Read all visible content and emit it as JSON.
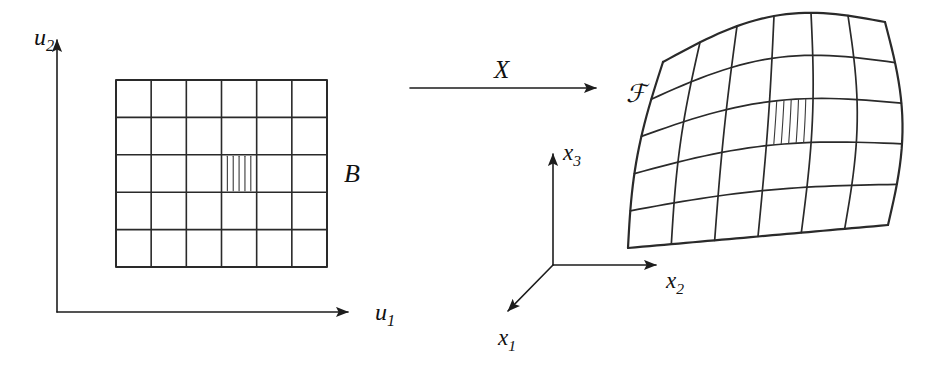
{
  "figure": {
    "type": "diagram",
    "background_color": "#ffffff",
    "ink_color": "#2a2a2a"
  },
  "labels": {
    "u_axis_vertical": "u",
    "u_axis_vertical_sub": "2",
    "u_axis_horizontal": "u",
    "u_axis_horizontal_sub": "1",
    "map_arrow": "X",
    "domain_region": "B",
    "image_region": "ℱ",
    "x1_axis": "x",
    "x1_axis_sub": "1",
    "x2_axis": "x",
    "x2_axis_sub": "2",
    "x3_axis": "x",
    "x3_axis_sub": "3"
  },
  "domain_grid": {
    "name": "B",
    "columns": 6,
    "rows": 5,
    "x0": 116,
    "y0": 80,
    "width": 211,
    "height": 187,
    "highlighted_cell": {
      "col": 4,
      "row": 3,
      "hatch_lines": 5
    }
  },
  "image_surface": {
    "name": "ℱ",
    "columns": 6,
    "rows": 5,
    "corners": {
      "top_left": [
        663,
        62
      ],
      "top_right": [
        885,
        22
      ],
      "bottom_right": [
        888,
        225
      ],
      "bottom_left": [
        628,
        248
      ]
    },
    "highlighted_cell": {
      "col": 4,
      "row": 3,
      "hatch_lines": 5
    }
  },
  "axes_2d": {
    "origin": [
      57,
      312
    ],
    "vertical_tip": [
      57,
      38
    ],
    "horizontal_tip": [
      352,
      312
    ]
  },
  "axes_3d": {
    "origin": [
      553,
      265
    ],
    "x3_tip": [
      553,
      152
    ],
    "x2_tip": [
      660,
      265
    ],
    "x1_tip": [
      505,
      314
    ]
  },
  "map_arrow": {
    "start": [
      410,
      88
    ],
    "end": [
      600,
      88
    ],
    "label": "X"
  }
}
